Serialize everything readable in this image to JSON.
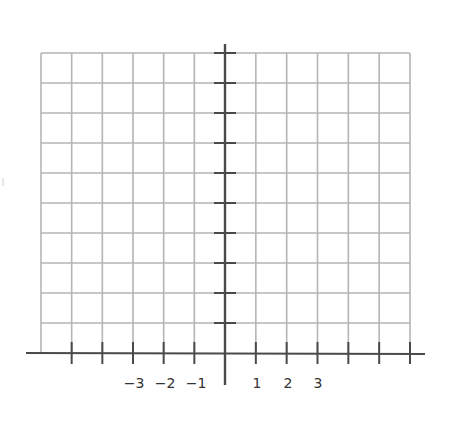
{
  "diagram": {
    "type": "coordinate-grid",
    "colors": {
      "grid": "#b5b5b5",
      "axis": "#4a4a4a",
      "label": "#333333"
    },
    "grid": {
      "left": 41,
      "right": 410,
      "top": 53,
      "bottom": 353,
      "cell": 30.75,
      "rows": 10,
      "cols_left": 6,
      "cols_right": 6
    },
    "origin": {
      "x": 225,
      "y": 353
    },
    "x_axis": {
      "from": 26,
      "to": 425
    },
    "y_axis": {
      "from": 44,
      "to": 385
    },
    "x_tick_labels": [
      {
        "text": "−3",
        "x": 134
      },
      {
        "text": "−2",
        "x": 165
      },
      {
        "text": "−1",
        "x": 196
      },
      {
        "text": "1",
        "x": 257
      },
      {
        "text": "2",
        "x": 288
      },
      {
        "text": "3",
        "x": 318
      }
    ]
  }
}
